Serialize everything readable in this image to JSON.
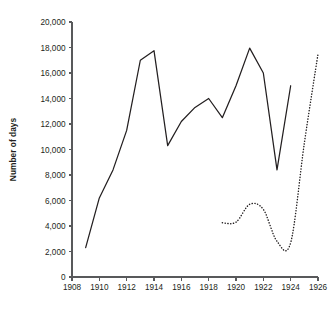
{
  "chart_data": {
    "type": "line",
    "title": "",
    "xlabel": "",
    "ylabel": "Number of days",
    "xlim": [
      1908,
      1926
    ],
    "ylim": [
      0,
      20000
    ],
    "grid": false,
    "legend": "none",
    "x_ticks": [
      1908,
      1910,
      1912,
      1914,
      1916,
      1918,
      1920,
      1922,
      1924,
      1926
    ],
    "x_tick_labels": [
      "1908",
      "1910",
      "1912",
      "1914",
      "1916",
      "1918",
      "1920",
      "1922",
      "1924",
      "1926"
    ],
    "x_minor_ticks": [
      1909,
      1911,
      1913,
      1915,
      1917,
      1919,
      1921,
      1923,
      1925
    ],
    "y_ticks": [
      0,
      2000,
      4000,
      6000,
      8000,
      10000,
      12000,
      14000,
      16000,
      18000,
      20000
    ],
    "y_tick_labels": [
      "0",
      "2,000",
      "4,000",
      "6,000",
      "8,000",
      "10,000",
      "12,000",
      "14,000",
      "16,000",
      "18,000",
      "20,000"
    ],
    "series": [
      {
        "name": "solid-series",
        "style": "solid",
        "color": "#231f20",
        "x": [
          1909,
          1910,
          1911,
          1912,
          1913,
          1914,
          1915,
          1916,
          1917,
          1918,
          1919,
          1920,
          1921,
          1922,
          1923,
          1924
        ],
        "values": [
          2300,
          6200,
          8400,
          11500,
          17000,
          17750,
          10300,
          12200,
          13300,
          14000,
          12500,
          15000,
          17950,
          16000,
          8400,
          15000
        ]
      },
      {
        "name": "dotted-series",
        "style": "dotted",
        "color": "#231f20",
        "x": [
          1919,
          1920,
          1921,
          1922,
          1923,
          1924,
          1925,
          1926
        ],
        "values": [
          4250,
          4300,
          5700,
          5300,
          2800,
          2700,
          10500,
          17500
        ]
      }
    ]
  },
  "geometry": {
    "plot_left": 72,
    "plot_right": 318,
    "plot_top": 22,
    "plot_bottom": 277,
    "tick_len": 3.5
  }
}
